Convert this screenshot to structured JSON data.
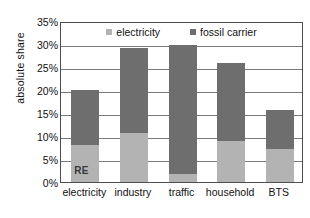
{
  "chart_data": {
    "type": "bar",
    "title": "",
    "subtitle": "",
    "xlabel": "",
    "ylabel": "absolute share",
    "stacked": true,
    "grid": true,
    "legend_position": "top-inside",
    "ylim": [
      0,
      35
    ],
    "ytick_step": 5,
    "ytick_labels": [
      "0%",
      "5%",
      "10%",
      "15%",
      "20%",
      "25%",
      "30%",
      "35%"
    ],
    "ytick_values": [
      0,
      5,
      10,
      15,
      20,
      25,
      30,
      35
    ],
    "categories": [
      "electricity",
      "industry",
      "traffic",
      "household",
      "BTS"
    ],
    "series": [
      {
        "name": "electricity",
        "color": "#b3b3b3",
        "values": [
          8.0,
          10.6,
          1.8,
          8.9,
          7.2
        ]
      },
      {
        "name": "fossil carrier",
        "color": "#6e6e6e",
        "values": [
          12.0,
          18.6,
          27.9,
          17.0,
          8.5
        ]
      }
    ],
    "totals": [
      20.0,
      29.2,
      29.7,
      25.9,
      15.7
    ],
    "annotations": [
      {
        "text": "RE",
        "category": "electricity",
        "series": "electricity",
        "placement": "inside-bottom"
      }
    ]
  },
  "legend": {
    "items": [
      {
        "label": "electricity",
        "color": "#b3b3b3",
        "icon": "square-swatch-icon"
      },
      {
        "label": "fossil carrier",
        "color": "#6e6e6e",
        "icon": "square-swatch-icon"
      }
    ]
  },
  "axes": {
    "y_title": "absolute share"
  },
  "colors": {
    "electricity": "#b3b3b3",
    "fossil_carrier": "#6e6e6e",
    "grid": "#7a7a7a",
    "frame": "#4d4d4d",
    "background": "#ffffff",
    "text": "#111111"
  }
}
